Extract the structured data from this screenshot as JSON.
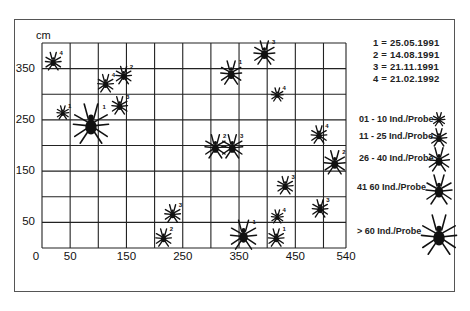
{
  "chart_data": {
    "type": "scatter",
    "title": "",
    "xlabel": "",
    "ylabel": "cm",
    "x_unit": "cm",
    "xlim": [
      0,
      540
    ],
    "ylim": [
      0,
      400
    ],
    "x_ticks": [
      "0",
      "50",
      "150",
      "250",
      "350",
      "450",
      "540"
    ],
    "x_tick_values": [
      0,
      50,
      150,
      250,
      350,
      450,
      540
    ],
    "y_ticks": [
      "50",
      "150",
      "250",
      "350"
    ],
    "y_tick_values": [
      50,
      150,
      250,
      350
    ],
    "grid": true,
    "grid_x_step": 50,
    "grid_y_step": 50,
    "marker": "spider (mite) symbol sized by abundance class",
    "date_legend": [
      {
        "key": "1",
        "label": "1 = 25.05.1991"
      },
      {
        "key": "2",
        "label": "2 = 14.08.1991"
      },
      {
        "key": "3",
        "label": "3 = 21.11.1991"
      },
      {
        "key": "4",
        "label": "4 = 21.02.1992"
      }
    ],
    "size_legend": [
      {
        "class": 1,
        "label": "01 - 10 Ind./Probe"
      },
      {
        "class": 2,
        "label": "11 - 25 Ind./Probe"
      },
      {
        "class": 3,
        "label": "26 - 40 Ind./Probe"
      },
      {
        "class": 4,
        "label": "41   60 Ind./Probe"
      },
      {
        "class": 5,
        "label": "> 60 Ind./Probe"
      }
    ],
    "points": [
      {
        "x": 20,
        "y": 365,
        "date": "4",
        "size_class": 2
      },
      {
        "x": 37,
        "y": 265,
        "date": "1",
        "size_class": 1
      },
      {
        "x": 87,
        "y": 244,
        "date": "1",
        "size_class": 5
      },
      {
        "x": 113,
        "y": 322,
        "date": "4",
        "size_class": 2
      },
      {
        "x": 145,
        "y": 338,
        "date": "2",
        "size_class": 2
      },
      {
        "x": 138,
        "y": 279,
        "date": "3",
        "size_class": 2
      },
      {
        "x": 216,
        "y": 21,
        "date": "2",
        "size_class": 2
      },
      {
        "x": 232,
        "y": 68,
        "date": "3",
        "size_class": 2
      },
      {
        "x": 308,
        "y": 199,
        "date": "2",
        "size_class": 3
      },
      {
        "x": 338,
        "y": 199,
        "date": "3",
        "size_class": 3
      },
      {
        "x": 336,
        "y": 343,
        "date": "1",
        "size_class": 3
      },
      {
        "x": 395,
        "y": 382,
        "date": "3",
        "size_class": 3
      },
      {
        "x": 418,
        "y": 300,
        "date": "4",
        "size_class": 1
      },
      {
        "x": 358,
        "y": 27,
        "date": "1",
        "size_class": 4
      },
      {
        "x": 418,
        "y": 62,
        "date": "4",
        "size_class": 1
      },
      {
        "x": 416,
        "y": 21,
        "date": "1",
        "size_class": 2
      },
      {
        "x": 432,
        "y": 123,
        "date": "3",
        "size_class": 2
      },
      {
        "x": 492,
        "y": 222,
        "date": "4",
        "size_class": 2
      },
      {
        "x": 520,
        "y": 168,
        "date": "2",
        "size_class": 3
      },
      {
        "x": 494,
        "y": 78,
        "date": "3",
        "size_class": 2
      }
    ]
  },
  "axis": {
    "y_unit_label": "cm",
    "y_labels": [
      {
        "text": "350",
        "value": 350
      },
      {
        "text": "250",
        "value": 250
      },
      {
        "text": "150",
        "value": 150
      },
      {
        "text": "50",
        "value": 50
      }
    ],
    "x_labels": [
      {
        "text": "0",
        "value": 0
      },
      {
        "text": "50",
        "value": 50
      },
      {
        "text": "150",
        "value": 150
      },
      {
        "text": "250",
        "value": 250
      },
      {
        "text": "350",
        "value": 350
      },
      {
        "text": "450",
        "value": 450
      },
      {
        "text": "540",
        "value": 540
      }
    ]
  },
  "legend": {
    "dates": [
      "1 = 25.05.1991",
      "2 = 14.08.1991",
      "3 = 21.11.1991",
      "4 = 21.02.1992"
    ],
    "sizes": [
      "01 - 10 Ind./Probe",
      "11 - 25 Ind./Probe",
      "26 - 40 Ind./Probe",
      "41   60 Ind./Probe",
      "> 60 Ind./Probe"
    ]
  },
  "colors": {
    "ink": "#111111",
    "grid": "#222222",
    "frame": "#555555",
    "background": "#ffffff"
  }
}
